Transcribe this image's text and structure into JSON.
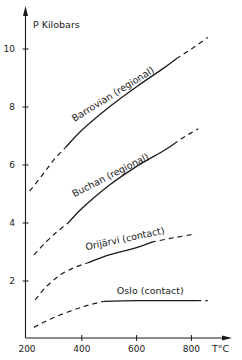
{
  "chart_data": {
    "type": "line",
    "title": "",
    "xlabel": "T°C",
    "ylabel": "P Kilobars",
    "xlim": [
      200,
      880
    ],
    "ylim": [
      0,
      11
    ],
    "x_ticks": [
      200,
      400,
      600,
      800
    ],
    "y_ticks": [
      2,
      4,
      6,
      8,
      10
    ],
    "grid": false,
    "legend": "inline labels on curves",
    "series": [
      {
        "name": "Barrovian (regional)",
        "dashed_low": [
          [
            210,
            5.1
          ],
          [
            260,
            5.7
          ],
          [
            300,
            6.2
          ],
          [
            340,
            6.6
          ]
        ],
        "solid": [
          [
            340,
            6.6
          ],
          [
            400,
            7.2
          ],
          [
            500,
            8.0
          ],
          [
            600,
            8.7
          ],
          [
            700,
            9.35
          ],
          [
            750,
            9.7
          ]
        ],
        "dashed_high": [
          [
            750,
            9.7
          ],
          [
            800,
            10.0
          ],
          [
            860,
            10.4
          ]
        ]
      },
      {
        "name": "Buchan (regional)",
        "dashed_low": [
          [
            225,
            2.9
          ],
          [
            270,
            3.35
          ],
          [
            310,
            3.7
          ],
          [
            350,
            4.0
          ]
        ],
        "solid": [
          [
            350,
            4.0
          ],
          [
            400,
            4.5
          ],
          [
            500,
            5.3
          ],
          [
            600,
            5.95
          ],
          [
            700,
            6.5
          ],
          [
            740,
            6.75
          ]
        ],
        "dashed_high": [
          [
            740,
            6.75
          ],
          [
            780,
            7.0
          ],
          [
            825,
            7.25
          ]
        ]
      },
      {
        "name": "Orijärvi (contact)",
        "dashed_low": [
          [
            230,
            1.35
          ],
          [
            270,
            1.8
          ],
          [
            320,
            2.2
          ],
          [
            370,
            2.45
          ],
          [
            420,
            2.62
          ]
        ],
        "solid": [
          [
            420,
            2.62
          ],
          [
            500,
            2.9
          ],
          [
            600,
            3.15
          ],
          [
            660,
            3.35
          ]
        ],
        "dashed_high": [
          [
            660,
            3.35
          ],
          [
            740,
            3.5
          ],
          [
            815,
            3.62
          ]
        ]
      },
      {
        "name": "Oslo (contact)",
        "dashed_low": [
          [
            225,
            0.4
          ],
          [
            300,
            0.75
          ],
          [
            400,
            1.1
          ],
          [
            480,
            1.3
          ]
        ],
        "solid": [
          [
            480,
            1.3
          ],
          [
            600,
            1.32
          ],
          [
            700,
            1.32
          ],
          [
            825,
            1.32
          ]
        ],
        "dashed_high": [
          [
            825,
            1.32
          ],
          [
            860,
            1.32
          ]
        ]
      }
    ],
    "labels": [
      {
        "text": "Barrovian (regional)",
        "x": 520,
        "y": 8.35,
        "angle": -32
      },
      {
        "text": "Buchan (regional)",
        "x": 510,
        "y": 5.55,
        "angle": -27
      },
      {
        "text": "Orijärvi (contact)",
        "x": 560,
        "y": 3.35,
        "angle": -12
      },
      {
        "text": "Oslo (contact)",
        "x": 650,
        "y": 1.55,
        "angle": 0
      }
    ]
  },
  "axes": {
    "y_title": "P Kilobars",
    "x_title": "T°C",
    "y_tick_labels": [
      "2",
      "4",
      "6",
      "8",
      "10"
    ],
    "x_tick_labels": [
      "200",
      "400",
      "600",
      "800"
    ]
  },
  "colors": {
    "ink": "#1a1a1a",
    "background": "#ffffff"
  }
}
